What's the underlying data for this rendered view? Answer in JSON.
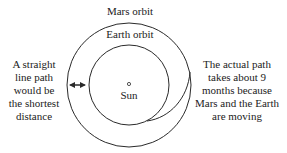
{
  "labels": {
    "mars_orbit": "Mars orbit",
    "earth_orbit": "Earth orbit",
    "sun": "Sun",
    "left_note": [
      "A straight",
      "line path",
      "would be",
      "the shortest",
      "distance"
    ],
    "right_note": [
      "The actual path",
      "takes about 9",
      "months because",
      "Mars and the Earth",
      "are moving"
    ]
  },
  "geometry": {
    "sun_center": [
      129,
      84
    ],
    "earth_orbit_radius": 40,
    "mars_orbit_radius": 62
  },
  "colors": {
    "stroke": "#2a2a2a",
    "text": "#222222",
    "background": "#ffffff"
  }
}
